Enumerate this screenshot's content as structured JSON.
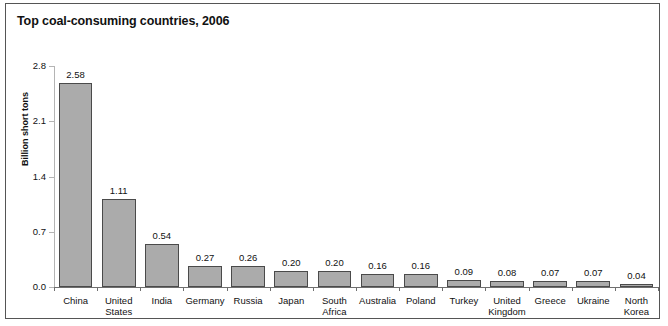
{
  "chart_data": {
    "type": "bar",
    "title": "Top coal-consuming countries, 2006",
    "xlabel": "",
    "ylabel": "Billion short tons",
    "ylim": [
      0.0,
      2.8
    ],
    "yticks": [
      "0.0",
      "0.7",
      "1.4",
      "2.1",
      "2.8"
    ],
    "ytick_values": [
      0.0,
      0.7,
      1.4,
      2.1,
      2.8
    ],
    "grid": false,
    "legend": "none",
    "bar_color": "#ababab",
    "bar_edge_color": "#4a4a4a",
    "categories": [
      "China",
      "United\nStates",
      "India",
      "Germany",
      "Russia",
      "Japan",
      "South\nAfrica",
      "Australia",
      "Poland",
      "Turkey",
      "United\nKingdom",
      "Greece",
      "Ukraine",
      "North\nKorea"
    ],
    "values": [
      2.58,
      1.11,
      0.54,
      0.27,
      0.26,
      0.2,
      0.2,
      0.16,
      0.16,
      0.09,
      0.08,
      0.07,
      0.07,
      0.04
    ],
    "value_labels": [
      "2.58",
      "1.11",
      "0.54",
      "0.27",
      "0.26",
      "0.20",
      "0.20",
      "0.16",
      "0.16",
      "0.09",
      "0.08",
      "0.07",
      "0.07",
      "0.04"
    ]
  }
}
